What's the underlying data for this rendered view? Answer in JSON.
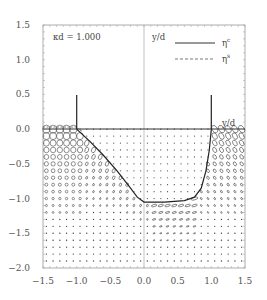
{
  "chart_data": {
    "type": "vector-field",
    "title": "",
    "annotations": {
      "parameter": "κd = 1.000",
      "ylabel_inside": "y/d",
      "right_wall_label": "y/d"
    },
    "legend": {
      "position": "upper right",
      "entries": [
        {
          "label": "η",
          "superscript": "c",
          "style": "solid"
        },
        {
          "label": "η",
          "superscript": "s",
          "style": "dashed"
        }
      ]
    },
    "xlim": [
      -1.5,
      1.5
    ],
    "ylim": [
      -2.0,
      1.5
    ],
    "x_ticks": [
      "-1.5",
      "-1.0",
      "-0.5",
      "0.0",
      "0.5",
      "1.0",
      "1.5"
    ],
    "y_ticks": [
      "1.5",
      "1.0",
      "0.5",
      "0.0",
      "-0.5",
      "-1.0",
      "-1.5",
      "-2.0"
    ],
    "grid": false,
    "walls": [
      {
        "x": -1.0,
        "y_from": 0.0,
        "y_to": 0.5
      },
      {
        "x": 1.0,
        "y_from": 0.0,
        "y_to": 0.5
      }
    ],
    "free_surface_y": 0.0,
    "trench_profile": {
      "x": [
        -1.0,
        -0.8,
        -0.6,
        -0.4,
        -0.2,
        -0.1,
        0.0,
        0.3,
        0.6,
        0.75,
        0.85,
        0.92,
        0.97,
        1.0
      ],
      "y": [
        0.0,
        -0.18,
        -0.38,
        -0.6,
        -0.85,
        -0.98,
        -1.05,
        -1.05,
        -1.03,
        -0.98,
        -0.85,
        -0.6,
        -0.3,
        0.0
      ]
    },
    "vector_field": {
      "description": "Particle orbit ellipses: large circles near upper-left outside trench, tilted ellipses near trench edges, dots inside trench region",
      "grid_spacing": 0.1
    }
  }
}
